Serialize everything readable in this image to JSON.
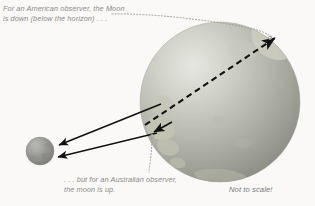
{
  "diagram": {
    "background_color": "#faf9f7",
    "text_color": "#8b8b88"
  },
  "captions": {
    "american": {
      "line1": "For an American observer, the Moon",
      "line2": "is down (below the horizon) . . ."
    },
    "australian": {
      "line1": ". . . but for an Australian observer,",
      "line2": "the moon is up."
    },
    "scale_note": "Not to scale!"
  },
  "bodies": {
    "earth": {
      "label": "earth",
      "cx": 220,
      "cy": 102,
      "r": 80,
      "base_color": "#a9aaa0",
      "highlight_color": "#d8d9d2",
      "land_color": "#c9cabc"
    },
    "moon": {
      "label": "moon",
      "cx": 40,
      "cy": 151,
      "r": 14,
      "base_color": "#8e8e8c",
      "highlight_color": "#b4b4b0"
    }
  },
  "arrows": {
    "sight_upper": {
      "label": "line-of-sight-from-american-observer-side",
      "x1": 161,
      "y1": 104,
      "x2": 57,
      "y2": 145
    },
    "sight_lower": {
      "label": "line-of-sight-from-australian-observer",
      "x1": 157,
      "y1": 133,
      "x2": 56,
      "y2": 157
    },
    "observer_marker": {
      "label": "australian-observer-marker",
      "x1": 170,
      "y1": 122,
      "x2": 152,
      "y2": 133
    },
    "through_earth": {
      "label": "dashed-line-through-earth-to-zenith",
      "x1": 145,
      "y1": 125,
      "x2": 278,
      "y2": 36
    }
  },
  "leaders": {
    "moon_leader": {
      "label": "dotted-leader-to-zenith-arrow",
      "points": "112,14 150,14 200,18 240,24 262,31 272,36"
    },
    "observer_leader": {
      "label": "dotted-leader-to-observer-marker",
      "points": "152,136 152,150 150,162 149,172"
    }
  }
}
